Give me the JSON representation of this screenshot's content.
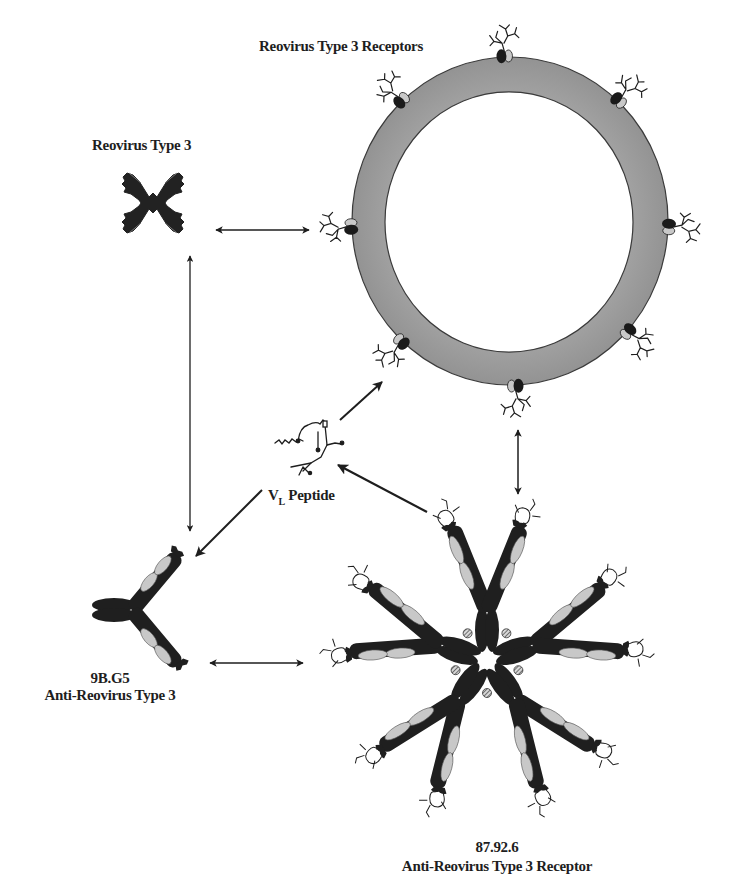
{
  "diagram": {
    "type": "schematic",
    "colors": {
      "ink": "#1e1e1e",
      "membrane": "#9d9d9d",
      "membrane_edge": "#3a3a3a",
      "light_domain": "#c8c8c8",
      "background": "#ffffff"
    },
    "labels": {
      "receptors": "Reovirus Type 3 Receptors",
      "virus": "Reovirus Type 3",
      "peptide_main": "V",
      "peptide_sub": "L",
      "peptide_rest": " Peptide",
      "antibody_id": "9B.G5",
      "antibody_name": "Anti-Reovirus Type 3",
      "anti_id_id": "87.92.6",
      "anti_id_name": "Anti-Reovirus Type 3 Receptor"
    },
    "nodes": [
      {
        "id": "virus",
        "name": "Reovirus Type 3",
        "glyph": "virus-particle"
      },
      {
        "id": "cell",
        "name": "Reovirus Type 3 Receptors",
        "glyph": "cell-membrane-with-receptors",
        "receptor_count": 8
      },
      {
        "id": "peptide",
        "name": "VL Peptide",
        "glyph": "peptide-chain"
      },
      {
        "id": "ab1",
        "name": "9B.G5 Anti-Reovirus Type 3",
        "glyph": "igg-antibody"
      },
      {
        "id": "ab2",
        "name": "87.92.6 Anti-Reovirus Type 3 Receptor",
        "glyph": "igm-pentamer",
        "subunits": 5
      }
    ],
    "edges": [
      {
        "from": "virus",
        "to": "cell",
        "kind": "double-arrow"
      },
      {
        "from": "virus",
        "to": "ab1",
        "kind": "double-arrow"
      },
      {
        "from": "cell",
        "to": "ab2",
        "kind": "double-arrow"
      },
      {
        "from": "ab1",
        "to": "ab2",
        "kind": "double-arrow"
      },
      {
        "from": "peptide",
        "to": "cell",
        "kind": "arrow"
      },
      {
        "from": "ab2",
        "to": "peptide",
        "kind": "arrow"
      },
      {
        "from": "peptide",
        "to": "ab1",
        "kind": "arrow"
      }
    ]
  }
}
